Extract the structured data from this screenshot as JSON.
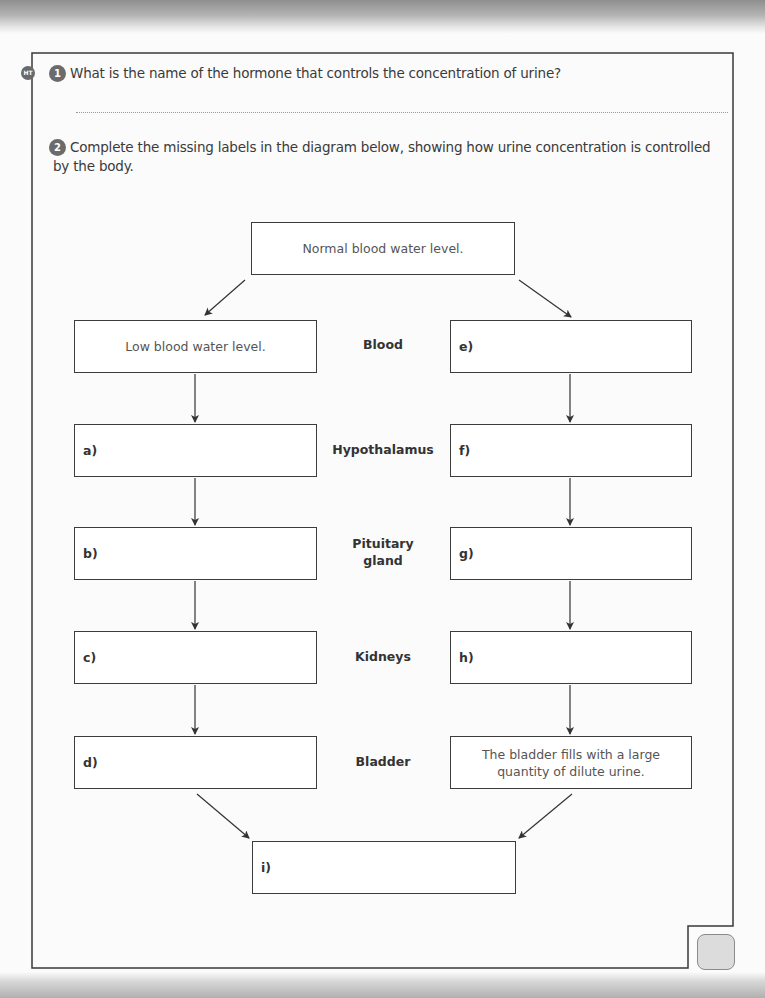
{
  "badge": {
    "label": "HT"
  },
  "questions": [
    {
      "number": "1",
      "text": "What is the name of the hormone that controls the concentration of urine?"
    },
    {
      "number": "2",
      "text_line1": "Complete the missing labels in the diagram below, showing how urine concentration is controlled",
      "text_line2": "by the body."
    }
  ],
  "diagram": {
    "top_box": "Normal blood water level.",
    "organs": [
      "Blood",
      "Hypothalamus",
      "Pituitary",
      "gland",
      "Kidneys",
      "Bladder"
    ],
    "left_column": {
      "start": "Low blood water level.",
      "labels": [
        "a)",
        "b)",
        "c)",
        "d)"
      ]
    },
    "right_column": {
      "labels": [
        "e)",
        "f)",
        "g)",
        "h)"
      ],
      "end_line1": "The bladder fills with a large",
      "end_line2": "quantity of dilute urine."
    },
    "final_box": "i)"
  },
  "colors": {
    "frame": "#3a3a3a",
    "badge": "#6a6a6a",
    "score_box": "#dcdcdc"
  }
}
